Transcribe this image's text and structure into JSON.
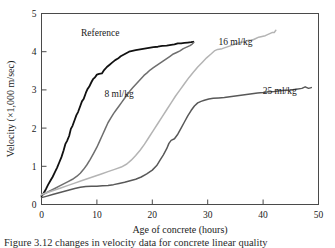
{
  "chart_data": {
    "type": "line",
    "title": "",
    "xlabel": "Age of concrete (hours)",
    "ylabel": "Velocity (×1,000 m/sec)",
    "xlim": [
      0,
      50
    ],
    "ylim": [
      0,
      5
    ],
    "xticks": [
      "0",
      "10",
      "20",
      "30",
      "40",
      "50"
    ],
    "xtick_values": [
      0,
      10,
      20,
      30,
      40,
      50
    ],
    "yticks": [
      "0",
      "1",
      "2",
      "3",
      "4",
      "5"
    ],
    "ytick_values": [
      0,
      1,
      2,
      3,
      4,
      5
    ],
    "grid": false,
    "legend_position": "inline-annotations",
    "series": [
      {
        "name": "Reference",
        "color": "#111111",
        "width": 1.8,
        "label_x": 10.6,
        "label_y": 4.42,
        "points": [
          [
            0.0,
            0.22
          ],
          [
            0.4,
            0.3
          ],
          [
            0.8,
            0.4
          ],
          [
            1.2,
            0.52
          ],
          [
            1.6,
            0.62
          ],
          [
            2.0,
            0.72
          ],
          [
            2.4,
            0.84
          ],
          [
            2.8,
            0.96
          ],
          [
            3.2,
            1.1
          ],
          [
            3.6,
            1.24
          ],
          [
            4.0,
            1.42
          ],
          [
            4.3,
            1.58
          ],
          [
            4.6,
            1.66
          ],
          [
            5.0,
            1.8
          ],
          [
            5.3,
            1.98
          ],
          [
            5.6,
            2.06
          ],
          [
            6.0,
            2.22
          ],
          [
            6.3,
            2.34
          ],
          [
            6.6,
            2.42
          ],
          [
            7.0,
            2.58
          ],
          [
            7.3,
            2.7
          ],
          [
            7.6,
            2.76
          ],
          [
            8.0,
            2.92
          ],
          [
            8.3,
            3.02
          ],
          [
            8.6,
            3.08
          ],
          [
            9.0,
            3.2
          ],
          [
            9.3,
            3.28
          ],
          [
            9.6,
            3.32
          ],
          [
            10.0,
            3.4
          ],
          [
            10.4,
            3.42
          ],
          [
            10.9,
            3.43
          ],
          [
            11.3,
            3.52
          ],
          [
            11.8,
            3.6
          ],
          [
            12.3,
            3.66
          ],
          [
            12.8,
            3.72
          ],
          [
            13.3,
            3.78
          ],
          [
            13.8,
            3.82
          ],
          [
            14.3,
            3.88
          ],
          [
            14.8,
            3.92
          ],
          [
            15.3,
            3.96
          ],
          [
            15.8,
            4.0
          ],
          [
            16.4,
            4.02
          ],
          [
            17.0,
            4.04
          ],
          [
            17.8,
            4.06
          ],
          [
            18.6,
            4.08
          ],
          [
            19.4,
            4.1
          ],
          [
            20.2,
            4.12
          ],
          [
            21.0,
            4.13
          ],
          [
            21.8,
            4.15
          ],
          [
            22.6,
            4.16
          ],
          [
            23.4,
            4.18
          ],
          [
            24.0,
            4.19
          ],
          [
            24.6,
            4.22
          ],
          [
            25.2,
            4.22
          ],
          [
            25.8,
            4.23
          ],
          [
            26.4,
            4.24
          ],
          [
            27.0,
            4.25
          ],
          [
            27.4,
            4.26
          ]
        ]
      },
      {
        "name": "8 ml/kg",
        "color": "#6e6e6e",
        "width": 1.5,
        "label_x": 14.0,
        "label_y": 2.82,
        "points": [
          [
            0.0,
            0.24
          ],
          [
            0.8,
            0.3
          ],
          [
            1.6,
            0.36
          ],
          [
            2.4,
            0.42
          ],
          [
            3.2,
            0.48
          ],
          [
            4.0,
            0.54
          ],
          [
            4.8,
            0.6
          ],
          [
            5.6,
            0.66
          ],
          [
            6.4,
            0.74
          ],
          [
            7.0,
            0.82
          ],
          [
            7.6,
            0.92
          ],
          [
            8.2,
            1.04
          ],
          [
            8.8,
            1.18
          ],
          [
            9.4,
            1.34
          ],
          [
            10.0,
            1.5
          ],
          [
            10.5,
            1.66
          ],
          [
            11.0,
            1.82
          ],
          [
            11.5,
            1.98
          ],
          [
            12.0,
            2.14
          ],
          [
            12.5,
            2.26
          ],
          [
            13.0,
            2.38
          ],
          [
            13.5,
            2.48
          ],
          [
            14.0,
            2.58
          ],
          [
            14.5,
            2.68
          ],
          [
            15.0,
            2.78
          ],
          [
            15.5,
            2.88
          ],
          [
            16.0,
            2.98
          ],
          [
            16.5,
            3.06
          ],
          [
            17.0,
            3.14
          ],
          [
            17.5,
            3.22
          ],
          [
            18.0,
            3.3
          ],
          [
            18.5,
            3.38
          ],
          [
            19.0,
            3.44
          ],
          [
            19.6,
            3.52
          ],
          [
            20.2,
            3.58
          ],
          [
            20.8,
            3.64
          ],
          [
            21.4,
            3.7
          ],
          [
            22.0,
            3.76
          ],
          [
            22.6,
            3.82
          ],
          [
            23.2,
            3.88
          ],
          [
            23.8,
            3.94
          ],
          [
            24.4,
            3.98
          ],
          [
            25.0,
            4.02
          ],
          [
            25.6,
            4.08
          ],
          [
            26.2,
            4.12
          ],
          [
            26.8,
            4.16
          ],
          [
            27.2,
            4.2
          ],
          [
            27.5,
            4.24
          ]
        ]
      },
      {
        "name": "16 ml/kg",
        "color": "#b4b4b4",
        "width": 1.5,
        "label_x": 35.0,
        "label_y": 4.18,
        "points": [
          [
            0.0,
            0.26
          ],
          [
            1.2,
            0.32
          ],
          [
            2.4,
            0.38
          ],
          [
            3.6,
            0.44
          ],
          [
            4.8,
            0.5
          ],
          [
            6.0,
            0.56
          ],
          [
            7.2,
            0.62
          ],
          [
            8.4,
            0.68
          ],
          [
            9.6,
            0.74
          ],
          [
            10.8,
            0.8
          ],
          [
            12.0,
            0.86
          ],
          [
            13.2,
            0.92
          ],
          [
            14.4,
            0.98
          ],
          [
            15.4,
            1.06
          ],
          [
            16.2,
            1.16
          ],
          [
            17.0,
            1.28
          ],
          [
            17.8,
            1.42
          ],
          [
            18.6,
            1.58
          ],
          [
            19.4,
            1.76
          ],
          [
            20.2,
            1.94
          ],
          [
            21.0,
            2.12
          ],
          [
            21.8,
            2.3
          ],
          [
            22.6,
            2.48
          ],
          [
            23.4,
            2.66
          ],
          [
            24.2,
            2.84
          ],
          [
            25.0,
            3.0
          ],
          [
            25.8,
            3.16
          ],
          [
            26.6,
            3.32
          ],
          [
            27.4,
            3.46
          ],
          [
            28.2,
            3.6
          ],
          [
            29.0,
            3.72
          ],
          [
            29.8,
            3.84
          ],
          [
            30.6,
            3.94
          ],
          [
            31.2,
            4.02
          ],
          [
            31.8,
            4.06
          ],
          [
            32.6,
            4.08
          ],
          [
            33.4,
            4.12
          ],
          [
            34.2,
            4.16
          ],
          [
            35.0,
            4.2
          ],
          [
            35.8,
            4.24
          ],
          [
            36.6,
            4.26
          ],
          [
            37.4,
            4.3
          ],
          [
            38.0,
            4.3
          ],
          [
            38.6,
            4.34
          ],
          [
            39.2,
            4.38
          ],
          [
            39.8,
            4.4
          ],
          [
            40.4,
            4.42
          ],
          [
            41.0,
            4.46
          ],
          [
            41.6,
            4.5
          ],
          [
            42.0,
            4.5
          ],
          [
            42.3,
            4.56
          ]
        ]
      },
      {
        "name": "25 ml/kg",
        "color": "#585858",
        "width": 1.5,
        "label_x": 43.0,
        "label_y": 2.88,
        "points": [
          [
            0.0,
            0.18
          ],
          [
            1.0,
            0.22
          ],
          [
            2.0,
            0.26
          ],
          [
            3.0,
            0.3
          ],
          [
            4.0,
            0.34
          ],
          [
            5.0,
            0.38
          ],
          [
            6.0,
            0.42
          ],
          [
            7.0,
            0.45
          ],
          [
            8.0,
            0.47
          ],
          [
            9.0,
            0.48
          ],
          [
            10.0,
            0.48
          ],
          [
            11.0,
            0.49
          ],
          [
            12.0,
            0.5
          ],
          [
            13.0,
            0.52
          ],
          [
            14.0,
            0.55
          ],
          [
            15.0,
            0.58
          ],
          [
            16.0,
            0.62
          ],
          [
            17.0,
            0.66
          ],
          [
            18.0,
            0.72
          ],
          [
            19.0,
            0.8
          ],
          [
            20.0,
            0.9
          ],
          [
            20.8,
            1.02
          ],
          [
            21.4,
            1.16
          ],
          [
            22.0,
            1.3
          ],
          [
            22.6,
            1.46
          ],
          [
            23.0,
            1.6
          ],
          [
            23.4,
            1.68
          ],
          [
            24.0,
            1.72
          ],
          [
            24.6,
            1.84
          ],
          [
            25.2,
            2.0
          ],
          [
            25.8,
            2.16
          ],
          [
            26.4,
            2.32
          ],
          [
            27.0,
            2.46
          ],
          [
            27.6,
            2.58
          ],
          [
            28.2,
            2.66
          ],
          [
            28.8,
            2.7
          ],
          [
            29.4,
            2.73
          ],
          [
            30.2,
            2.76
          ],
          [
            31.0,
            2.78
          ],
          [
            32.0,
            2.79
          ],
          [
            33.0,
            2.8
          ],
          [
            34.0,
            2.82
          ],
          [
            35.0,
            2.84
          ],
          [
            36.0,
            2.86
          ],
          [
            37.0,
            2.88
          ],
          [
            38.0,
            2.9
          ],
          [
            39.0,
            2.92
          ],
          [
            40.0,
            2.93
          ],
          [
            41.0,
            2.95
          ],
          [
            42.0,
            2.96
          ],
          [
            43.0,
            2.98
          ],
          [
            44.0,
            2.99
          ],
          [
            45.0,
            3.0
          ],
          [
            46.0,
            3.02
          ],
          [
            47.0,
            3.04
          ],
          [
            47.6,
            3.08
          ],
          [
            48.2,
            3.04
          ],
          [
            48.7,
            3.06
          ]
        ]
      }
    ]
  },
  "caption": {
    "text": "Figure 3.12   changes in velocity data for concrete linear quality"
  }
}
